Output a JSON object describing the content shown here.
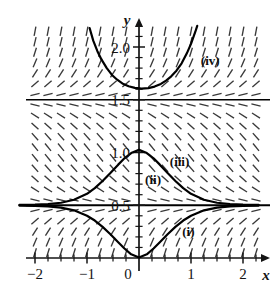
{
  "figure": {
    "kind": "slope-field-with-solution-curves",
    "width": 278,
    "height": 301,
    "background": "#ffffff",
    "ink_color": "#141414",
    "field_color": "#3a3a3a",
    "curve_color": "#000000"
  },
  "axes": {
    "x_axis_label": "x",
    "y_axis_label": "y",
    "x_ticks": [
      {
        "value": -2,
        "label": "−2"
      },
      {
        "value": -1,
        "label": "−1"
      },
      {
        "value": 0,
        "label": "0"
      },
      {
        "value": 1,
        "label": "1"
      },
      {
        "value": 2,
        "label": "2"
      }
    ],
    "y_ticks": [
      {
        "value": 0.5,
        "label": "0.5"
      },
      {
        "value": 1.0,
        "label": "1.0"
      },
      {
        "value": 1.5,
        "label": "1.5"
      },
      {
        "value": 2.0,
        "label": "2.0"
      }
    ],
    "x_minor_tick_step": 0.25,
    "y_minor_tick_step": 0.1,
    "x_range": [
      -2.35,
      2.3
    ],
    "y_range": [
      -0.12,
      2.2
    ],
    "has_arrowheads": true,
    "grid": false
  },
  "curve_labels": [
    {
      "id": "i",
      "text": "(i)",
      "x": 0.95,
      "y": 0.21
    },
    {
      "id": "ii",
      "text": "(ii)",
      "x": 0.27,
      "y": 0.7
    },
    {
      "id": "iii",
      "text": "(iii)",
      "x": 0.78,
      "y": 0.87
    },
    {
      "id": "iv",
      "text": "(iv)",
      "x": 1.37,
      "y": 1.83
    }
  ],
  "chart_data": {
    "type": "line",
    "title": "",
    "xlabel": "x",
    "ylabel": "y",
    "xlim": [
      -2.35,
      2.3
    ],
    "ylim": [
      -0.12,
      2.2
    ],
    "grid": false,
    "legend": "none",
    "equilibria": [
      {
        "y": 0.5,
        "stability": "stable",
        "drawn": true
      },
      {
        "y": 1.5,
        "stability": "unstable",
        "drawn": true
      }
    ],
    "series": [
      {
        "name": "(i)",
        "label": "(i)",
        "note": "lower solution below y=0.5, minimum near origin, rising to y=0.5 asymptotically on both sides",
        "points": [
          [
            -2.3,
            0.497
          ],
          [
            -2.0,
            0.494
          ],
          [
            -1.75,
            0.489
          ],
          [
            -1.5,
            0.478
          ],
          [
            -1.25,
            0.452
          ],
          [
            -1.0,
            0.4
          ],
          [
            -0.85,
            0.355
          ],
          [
            -0.7,
            0.295
          ],
          [
            -0.55,
            0.225
          ],
          [
            -0.4,
            0.15
          ],
          [
            -0.28,
            0.09
          ],
          [
            -0.15,
            0.035
          ],
          [
            0.0,
            0.005
          ],
          [
            0.15,
            0.035
          ],
          [
            0.28,
            0.09
          ],
          [
            0.4,
            0.15
          ],
          [
            0.55,
            0.225
          ],
          [
            0.7,
            0.295
          ],
          [
            0.85,
            0.355
          ],
          [
            1.0,
            0.4
          ],
          [
            1.25,
            0.452
          ],
          [
            1.5,
            0.478
          ],
          [
            1.75,
            0.489
          ],
          [
            2.0,
            0.494
          ],
          [
            2.3,
            0.497
          ]
        ]
      },
      {
        "name": "(ii)",
        "label": "(ii)",
        "note": "equilibrium solution y = 0.5 drawn as a full-width horizontal line",
        "points": [
          [
            -2.35,
            0.5
          ],
          [
            2.3,
            0.5
          ]
        ]
      },
      {
        "name": "(iii)",
        "label": "(iii)",
        "note": "upper solution between y=0.5 and y=1.5, maximum about y=1.03 at x=0, decaying to y=0.5 on both sides",
        "points": [
          [
            -2.3,
            0.503
          ],
          [
            -2.0,
            0.506
          ],
          [
            -1.75,
            0.512
          ],
          [
            -1.5,
            0.524
          ],
          [
            -1.25,
            0.552
          ],
          [
            -1.0,
            0.608
          ],
          [
            -0.85,
            0.662
          ],
          [
            -0.7,
            0.73
          ],
          [
            -0.55,
            0.805
          ],
          [
            -0.4,
            0.885
          ],
          [
            -0.28,
            0.945
          ],
          [
            -0.15,
            0.995
          ],
          [
            0.0,
            1.025
          ],
          [
            0.15,
            0.995
          ],
          [
            0.28,
            0.945
          ],
          [
            0.4,
            0.885
          ],
          [
            0.55,
            0.805
          ],
          [
            0.7,
            0.73
          ],
          [
            0.85,
            0.662
          ],
          [
            1.0,
            0.608
          ],
          [
            1.25,
            0.552
          ],
          [
            1.5,
            0.524
          ],
          [
            1.75,
            0.512
          ],
          [
            2.0,
            0.506
          ],
          [
            2.3,
            0.503
          ]
        ]
      },
      {
        "name": "equilibrium-1.5",
        "label": "",
        "note": "equilibrium solution y = 1.5 drawn as a full-width horizontal line",
        "points": [
          [
            -2.35,
            1.5
          ],
          [
            2.3,
            1.5
          ]
        ]
      },
      {
        "name": "(iv)",
        "label": "(iv)",
        "note": "upper solution above y=1.5, U-shaped with minimum about y=1.60 near x=0.1, rising steeply on both sides",
        "points": [
          [
            -0.95,
            2.18
          ],
          [
            -0.88,
            2.06
          ],
          [
            -0.8,
            1.96
          ],
          [
            -0.72,
            1.88
          ],
          [
            -0.62,
            1.8
          ],
          [
            -0.52,
            1.735
          ],
          [
            -0.42,
            1.69
          ],
          [
            -0.32,
            1.655
          ],
          [
            -0.2,
            1.628
          ],
          [
            -0.08,
            1.612
          ],
          [
            0.05,
            1.605
          ],
          [
            0.18,
            1.61
          ],
          [
            0.3,
            1.625
          ],
          [
            0.42,
            1.65
          ],
          [
            0.52,
            1.682
          ],
          [
            0.62,
            1.722
          ],
          [
            0.72,
            1.775
          ],
          [
            0.82,
            1.845
          ],
          [
            0.92,
            1.94
          ],
          [
            1.0,
            2.03
          ],
          [
            1.08,
            2.14
          ],
          [
            1.12,
            2.2
          ]
        ]
      }
    ]
  }
}
